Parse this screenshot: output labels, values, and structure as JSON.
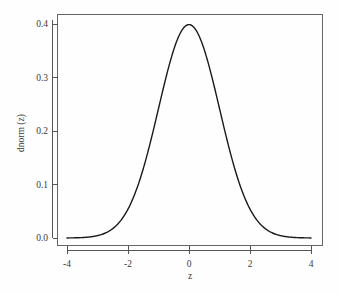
{
  "chart_data": {
    "type": "line",
    "title": "",
    "xlabel": "z",
    "ylabel": "dnorm (z)",
    "xlim": [
      -4,
      4
    ],
    "ylim": [
      0.0,
      0.4
    ],
    "grid": false,
    "legend": null,
    "curve_color": "#1a1a1a",
    "axis_color": "#555555",
    "background": "#fefefe",
    "xticks": [
      {
        "value": -4,
        "label": "-4"
      },
      {
        "value": -2,
        "label": "-2"
      },
      {
        "value": 0,
        "label": "0"
      },
      {
        "value": 2,
        "label": "2"
      },
      {
        "value": 4,
        "label": "4"
      }
    ],
    "yticks": [
      {
        "value": 0.0,
        "label": "0.0"
      },
      {
        "value": 0.1,
        "label": "0.1"
      },
      {
        "value": 0.2,
        "label": "0.2"
      },
      {
        "value": 0.3,
        "label": "0.3"
      },
      {
        "value": 0.4,
        "label": "0.4"
      }
    ],
    "series": [
      {
        "name": "dnorm(z)",
        "x": [
          -4.0,
          -3.8,
          -3.6,
          -3.4,
          -3.2,
          -3.0,
          -2.8,
          -2.6,
          -2.4,
          -2.2,
          -2.0,
          -1.8,
          -1.6,
          -1.4,
          -1.2,
          -1.0,
          -0.8,
          -0.6,
          -0.4,
          -0.2,
          0.0,
          0.2,
          0.4,
          0.6,
          0.8,
          1.0,
          1.2,
          1.4,
          1.6,
          1.8,
          2.0,
          2.2,
          2.4,
          2.6,
          2.8,
          3.0,
          3.2,
          3.4,
          3.6,
          3.8,
          4.0
        ],
        "y": [
          0.0001,
          0.0003,
          0.0006,
          0.0012,
          0.0024,
          0.0044,
          0.0079,
          0.0136,
          0.0224,
          0.0355,
          0.054,
          0.079,
          0.1109,
          0.1497,
          0.1942,
          0.242,
          0.2897,
          0.3332,
          0.3683,
          0.391,
          0.3989,
          0.391,
          0.3683,
          0.3332,
          0.2897,
          0.242,
          0.1942,
          0.1497,
          0.1109,
          0.079,
          0.054,
          0.0355,
          0.0224,
          0.0136,
          0.0079,
          0.0044,
          0.0024,
          0.0012,
          0.0006,
          0.0003,
          0.0001
        ]
      }
    ],
    "peak": {
      "x": 0,
      "y": 0.3989
    }
  },
  "labels": {
    "x_axis_title": "z",
    "y_axis_title": "dnorm (z)"
  }
}
